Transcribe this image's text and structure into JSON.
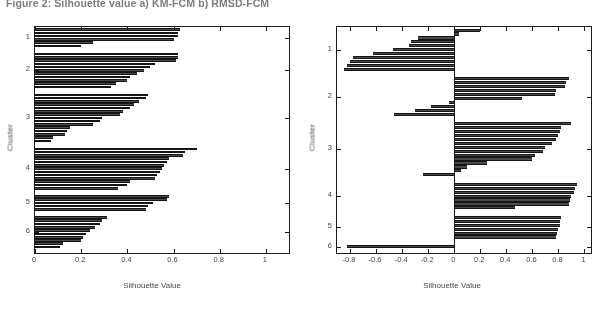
{
  "figure": {
    "caption": "Figure 2: Silhouette value a) KM-FCM b) RMSD-FCM"
  },
  "chart_data": [
    {
      "panel": "a",
      "type": "bar",
      "orientation": "horizontal",
      "title": "",
      "xlabel": "Silhouette Value",
      "ylabel": "Cluster",
      "xlim": [
        0,
        1.1
      ],
      "xticks": [
        0,
        0.2,
        0.4,
        0.6,
        0.8,
        1
      ],
      "xticklabels": [
        "0",
        "0.2",
        "0.4",
        "0.6",
        "0.8",
        "1"
      ],
      "yticks": [
        1,
        2,
        3,
        4,
        5,
        6
      ],
      "yticklabels": [
        "1",
        "2",
        "3",
        "4",
        "5",
        "6"
      ],
      "grid": false,
      "legend": null,
      "bar_color": "#4a4a4a",
      "clusters": [
        {
          "cluster": 1,
          "values": [
            0.63,
            0.62,
            0.62,
            0.6,
            0.25,
            0.2
          ]
        },
        {
          "cluster": 2,
          "values": [
            0.62,
            0.62,
            0.61,
            0.52,
            0.5,
            0.47,
            0.44,
            0.41,
            0.4,
            0.35,
            0.33
          ]
        },
        {
          "cluster": 3,
          "values": [
            0.49,
            0.48,
            0.45,
            0.43,
            0.41,
            0.38,
            0.37,
            0.29,
            0.28,
            0.25,
            0.15,
            0.14,
            0.13,
            0.08,
            0.07
          ]
        },
        {
          "cluster": 4,
          "values": [
            0.7,
            0.65,
            0.64,
            0.58,
            0.57,
            0.56,
            0.55,
            0.54,
            0.53,
            0.52,
            0.41,
            0.4,
            0.36
          ]
        },
        {
          "cluster": 5,
          "values": [
            0.58,
            0.57,
            0.51,
            0.49,
            0.48
          ]
        },
        {
          "cluster": 6,
          "values": [
            0.31,
            0.29,
            0.28,
            0.26,
            0.24,
            0.22,
            0.21,
            0.2,
            0.12,
            0.11
          ]
        }
      ]
    },
    {
      "panel": "b",
      "type": "bar",
      "orientation": "horizontal",
      "title": "",
      "xlabel": "Silhouette Value",
      "ylabel": "Cluster",
      "xlim": [
        -0.9,
        1.05
      ],
      "xticks": [
        -0.8,
        -0.6,
        -0.4,
        -0.2,
        0,
        0.2,
        0.4,
        0.6,
        0.8,
        1
      ],
      "xticklabels": [
        "-0.8",
        "-0.6",
        "-0.4",
        "-0.2",
        "0",
        "0.2",
        "0.4",
        "0.6",
        "0.8",
        "1"
      ],
      "yticks": [
        1,
        2,
        3,
        4,
        5,
        6
      ],
      "yticklabels": [
        "1",
        "2",
        "3",
        "4",
        "5",
        "6"
      ],
      "grid": false,
      "legend": null,
      "bar_color": "#4a4a4a",
      "zero_reference": 0,
      "clusters": [
        {
          "cluster": 1,
          "values": [
            0.2,
            0.04,
            -0.28,
            -0.33,
            -0.35,
            -0.47,
            -0.62,
            -0.78,
            -0.8,
            -0.82,
            -0.85
          ]
        },
        {
          "cluster": 2,
          "values": [
            0.88,
            0.86,
            0.85,
            0.78,
            0.77,
            0.52,
            -0.04,
            -0.18,
            -0.3,
            -0.46
          ]
        },
        {
          "cluster": 3,
          "values": [
            0.9,
            0.82,
            0.81,
            0.8,
            0.78,
            0.75,
            0.7,
            0.68,
            0.62,
            0.6,
            0.25,
            0.1,
            0.05,
            -0.24
          ]
        },
        {
          "cluster": 4,
          "values": [
            0.94,
            0.93,
            0.92,
            0.9,
            0.89,
            0.88,
            0.47
          ]
        },
        {
          "cluster": 5,
          "values": [
            0.82,
            0.81,
            0.81,
            0.8,
            0.79,
            0.78
          ]
        },
        {
          "cluster": 6,
          "values": [
            -0.82
          ]
        }
      ]
    }
  ]
}
